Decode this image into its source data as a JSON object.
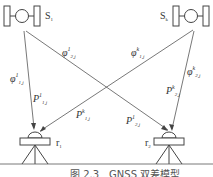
{
  "satellites": [
    {
      "id": "S1",
      "label": "S",
      "sub": "1"
    },
    {
      "id": "Sk",
      "label": "S",
      "sub": "k"
    }
  ],
  "receivers": [
    {
      "id": "r1",
      "label": "r",
      "sub": "1"
    },
    {
      "id": "r2",
      "label": "r",
      "sub": "2"
    }
  ],
  "signals": {
    "phi_1_1": {
      "sym": "φ",
      "sup": "1",
      "sub": "1,j"
    },
    "phi_2_1": {
      "sym": "φ",
      "sup": "1",
      "sub": "2,j"
    },
    "phi_1_k": {
      "sym": "φ",
      "sup": "k",
      "sub": "1,j"
    },
    "phi_2_k": {
      "sym": "φ",
      "sup": "k",
      "sub": "2,j"
    },
    "P_1_1": {
      "sym": "P",
      "sup": "1",
      "sub": "1,j"
    },
    "P_1_k": {
      "sym": "P",
      "sup": "k",
      "sub": "1,j"
    },
    "P_2_1": {
      "sym": "P",
      "sup": "1",
      "sub": "2,j"
    },
    "P_2_k": {
      "sym": "P",
      "sup": "k",
      "sub": "2,j"
    }
  },
  "caption": "图 2.3　GNSS 双差模型",
  "colors": {
    "line": "#555555",
    "text": "#333333"
  }
}
